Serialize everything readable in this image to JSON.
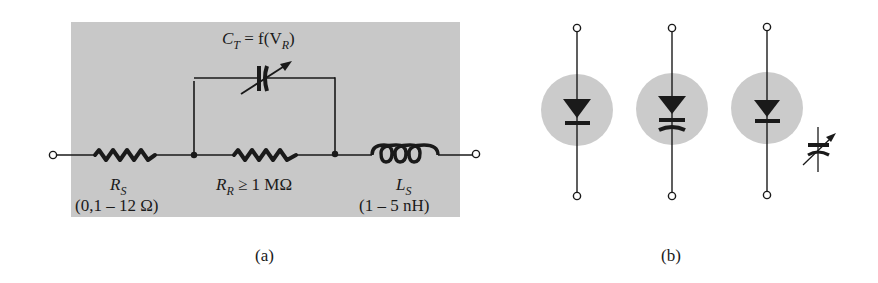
{
  "figure": {
    "panel_a": {
      "caption": "(a)",
      "capacitor_label": {
        "main": "C",
        "sub": "T",
        "rest": " = f(V",
        "sub2": "R",
        "close": ")"
      },
      "rs": {
        "main": "R",
        "sub": "S",
        "value": "(0,1 – 12 Ω)"
      },
      "rr": {
        "main": "R",
        "sub": "R",
        "rest": " ≥ 1 MΩ"
      },
      "ls": {
        "main": "L",
        "sub": "S",
        "value": "(1 – 5 nH)"
      }
    },
    "panel_b": {
      "caption": "(b)",
      "symbols": [
        {
          "name": "varactor-diode-symbol-1"
        },
        {
          "name": "varactor-diode-symbol-2"
        },
        {
          "name": "varactor-diode-symbol-3"
        }
      ]
    },
    "colors": {
      "panel_bg": "#c8c8c8",
      "circle_bg": "#cbcbcb",
      "ink": "#1a1a1a"
    }
  }
}
